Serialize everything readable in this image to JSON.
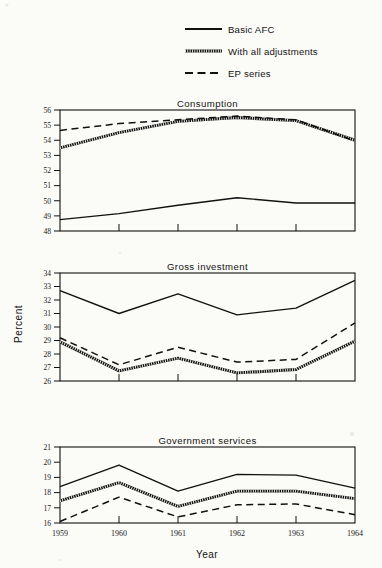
{
  "figure": {
    "background": "#fbfbf8",
    "ink": "#111111",
    "axis_title_y": "Percent",
    "axis_title_x": "Year"
  },
  "legend": {
    "position": "top-center",
    "entries": [
      {
        "label": "Basic AFC",
        "style": "solid"
      },
      {
        "label": "With all adjustments",
        "style": "hatched"
      },
      {
        "label": "EP series",
        "style": "dashed"
      }
    ]
  },
  "chart_data": [
    {
      "type": "line",
      "title": "Consumption",
      "xlabel": "Year",
      "ylabel": "Percent",
      "x": [
        1959,
        1960,
        1961,
        1962,
        1963,
        1964
      ],
      "categories": [
        "1959",
        "1960",
        "1961",
        "1962",
        "1963",
        "1964"
      ],
      "xlim": [
        1959,
        1964
      ],
      "ylim": [
        48,
        56
      ],
      "yticks": [
        48,
        49,
        50,
        51,
        52,
        53,
        54,
        55,
        56
      ],
      "grid": false,
      "series": [
        {
          "name": "Basic AFC",
          "style": "solid",
          "values": [
            48.75,
            49.15,
            49.7,
            50.2,
            49.85,
            49.85
          ]
        },
        {
          "name": "With all adjustments",
          "style": "hatched",
          "values": [
            53.5,
            54.5,
            55.25,
            55.5,
            55.3,
            54.0
          ]
        },
        {
          "name": "EP series",
          "style": "dashed",
          "values": [
            54.65,
            55.1,
            55.35,
            55.6,
            55.35,
            53.95
          ]
        }
      ]
    },
    {
      "type": "line",
      "title": "Gross investment",
      "xlabel": "Year",
      "ylabel": "Percent",
      "x": [
        1959,
        1960,
        1961,
        1962,
        1963,
        1964
      ],
      "categories": [
        "1959",
        "1960",
        "1961",
        "1962",
        "1963",
        "1964"
      ],
      "xlim": [
        1959,
        1964
      ],
      "ylim": [
        26,
        34
      ],
      "yticks": [
        26,
        27,
        28,
        29,
        30,
        31,
        32,
        33,
        34
      ],
      "grid": false,
      "series": [
        {
          "name": "Basic AFC",
          "style": "solid",
          "values": [
            32.7,
            31.0,
            32.45,
            30.9,
            31.4,
            33.45
          ]
        },
        {
          "name": "With all adjustments",
          "style": "hatched",
          "values": [
            28.9,
            26.75,
            27.7,
            26.6,
            26.85,
            28.95
          ]
        },
        {
          "name": "EP series",
          "style": "dashed",
          "values": [
            29.2,
            27.2,
            28.5,
            27.4,
            27.6,
            30.3
          ]
        }
      ]
    },
    {
      "type": "line",
      "title": "Government services",
      "xlabel": "Year",
      "ylabel": "Percent",
      "x": [
        1959,
        1960,
        1961,
        1962,
        1963,
        1964
      ],
      "categories": [
        "1959",
        "1960",
        "1961",
        "1962",
        "1963",
        "1964"
      ],
      "xlim": [
        1959,
        1964
      ],
      "ylim": [
        16,
        21
      ],
      "yticks": [
        16,
        17,
        18,
        19,
        20,
        21
      ],
      "grid": false,
      "series": [
        {
          "name": "Basic AFC",
          "style": "solid",
          "values": [
            18.4,
            19.8,
            18.1,
            19.2,
            19.15,
            18.3
          ]
        },
        {
          "name": "With all adjustments",
          "style": "hatched",
          "values": [
            17.45,
            18.65,
            17.1,
            18.1,
            18.1,
            17.6
          ]
        },
        {
          "name": "EP series",
          "style": "dashed",
          "values": [
            16.1,
            17.7,
            16.4,
            17.2,
            17.25,
            16.55
          ]
        }
      ]
    }
  ]
}
